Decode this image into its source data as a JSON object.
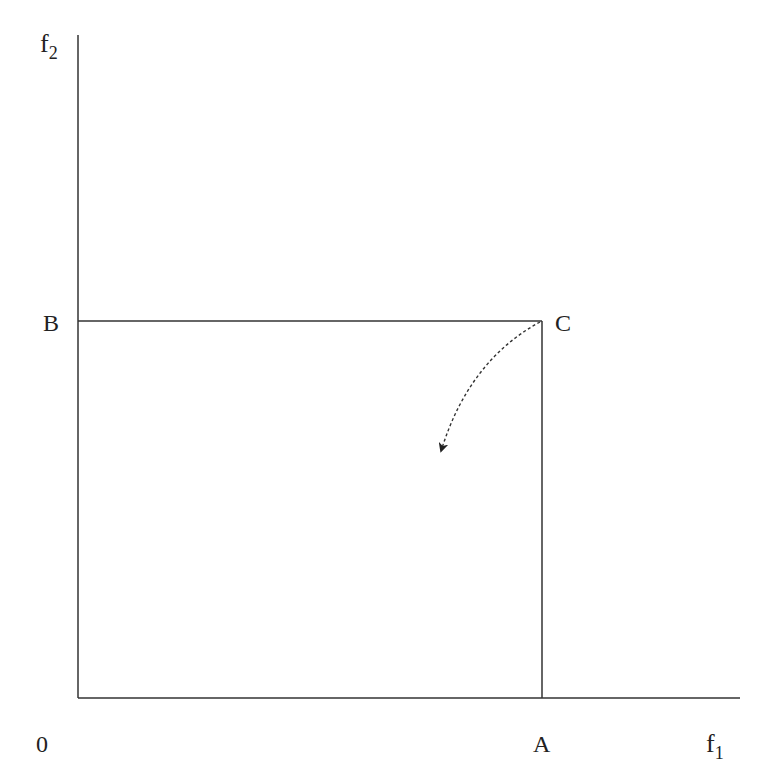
{
  "diagram": {
    "axes": {
      "x_label": "f",
      "x_sub": "1",
      "y_label": "f",
      "y_sub": "2",
      "origin_label": "0"
    },
    "points": {
      "A": "A",
      "B": "B",
      "C": "C"
    },
    "colors": {
      "line": "#333333",
      "text": "#222222",
      "background": "#ffffff"
    }
  }
}
